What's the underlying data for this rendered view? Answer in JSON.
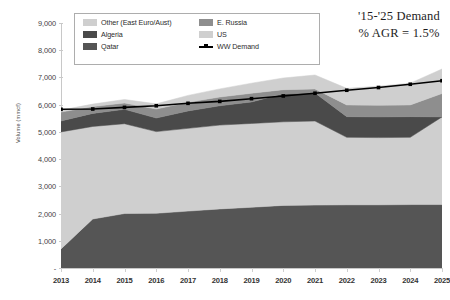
{
  "annotation": {
    "line1": "'15-'25 Demand",
    "line2": "% AGR = 1.5%"
  },
  "legend": {
    "items": [
      {
        "label": "Other (East Euro/Aust)",
        "color": "#cfcfcf",
        "type": "area"
      },
      {
        "label": "E. Russia",
        "color": "#8e8e8e",
        "type": "area"
      },
      {
        "label": "Algeria",
        "color": "#4a4a4a",
        "type": "area"
      },
      {
        "label": "US",
        "color": "#cfcfcf",
        "type": "area"
      },
      {
        "label": "Qatar",
        "color": "#555555",
        "type": "area"
      },
      {
        "label": "WW Demand",
        "color": "#000000",
        "type": "line"
      }
    ]
  },
  "axes": {
    "y_title": "Volume (mmcf)",
    "y_ticks": [
      "-",
      "1,000",
      "2,000",
      "3,000",
      "4,000",
      "5,000",
      "6,000",
      "7,000",
      "8,000",
      "9,000"
    ],
    "x_ticks": [
      "2013",
      "2014",
      "2015",
      "2016",
      "2017",
      "2018",
      "2019",
      "2020",
      "2021",
      "2022",
      "2023",
      "2024",
      "2025"
    ]
  },
  "chart_data": {
    "type": "area",
    "stacked": true,
    "title": "",
    "xlabel": "",
    "ylabel": "Volume (mmcf)",
    "ylim": [
      0,
      9000
    ],
    "ytick_step": 1000,
    "grid": false,
    "legend_position": "top-left",
    "categories": [
      "2013",
      "2014",
      "2015",
      "2016",
      "2017",
      "2018",
      "2019",
      "2020",
      "2021",
      "2022",
      "2023",
      "2024",
      "2025"
    ],
    "series": [
      {
        "name": "Qatar",
        "color": "#555555",
        "stack_order": 1,
        "values": [
          700,
          1800,
          2000,
          2010,
          2090,
          2170,
          2230,
          2300,
          2310,
          2320,
          2320,
          2330,
          2330
        ]
      },
      {
        "name": "US",
        "color": "#cfcfcf",
        "stack_order": 2,
        "values": [
          4300,
          3400,
          3300,
          3000,
          3040,
          3080,
          3080,
          3070,
          3090,
          2480,
          2470,
          2470,
          3220
        ]
      },
      {
        "name": "Algeria",
        "color": "#4a4a4a",
        "stack_order": 3,
        "values": [
          400,
          480,
          530,
          500,
          640,
          710,
          790,
          1030,
          1030,
          760,
          760,
          760,
          0
        ]
      },
      {
        "name": "E. Russia",
        "color": "#8e8e8e",
        "stack_order": 4,
        "values": [
          330,
          250,
          230,
          330,
          320,
          320,
          320,
          150,
          150,
          430,
          430,
          430,
          860
        ]
      },
      {
        "name": "Other (East Euro/Aust)",
        "color": "#cfcfcf",
        "stack_order": 5,
        "values": [
          70,
          90,
          130,
          190,
          250,
          300,
          370,
          430,
          510,
          610,
          700,
          800,
          900
        ]
      }
    ],
    "overlay_line": {
      "name": "WW Demand",
      "color": "#000000",
      "marker": "square",
      "values": [
        5830,
        5840,
        5900,
        5960,
        6050,
        6120,
        6220,
        6320,
        6420,
        6530,
        6630,
        6750,
        6880
      ]
    }
  }
}
